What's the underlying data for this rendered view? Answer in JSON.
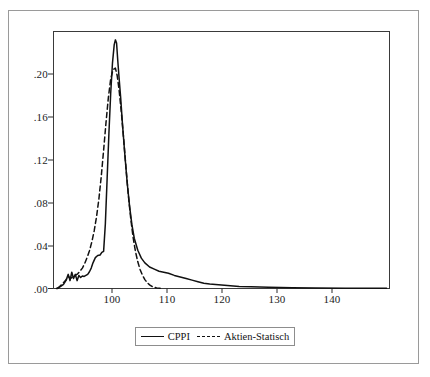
{
  "chart_data": {
    "type": "line",
    "title": "",
    "subtitle": "",
    "xlabel": "",
    "ylabel": "",
    "xlim": [
      91.5,
      148.5
    ],
    "ylim": [
      0.0,
      0.2455
    ],
    "grid": false,
    "legend_position": "bottom-center",
    "xticks": [
      100,
      110,
      120,
      130,
      140
    ],
    "xtick_labels": [
      "100",
      "110",
      "120",
      "130",
      "140"
    ],
    "yticks": [
      0.0,
      0.04,
      0.08,
      0.12,
      0.16,
      0.2
    ],
    "ytick_labels": [
      ".00",
      ".04",
      ".08",
      ".12",
      ".16",
      ".20"
    ],
    "series": [
      {
        "name": "CPPI",
        "style": "solid",
        "color": "#111111",
        "x": [
          92.0,
          92.6,
          93.2,
          93.6,
          94.0,
          94.3,
          94.6,
          94.9,
          95.2,
          95.5,
          95.8,
          96.1,
          96.4,
          96.7,
          97.0,
          97.3,
          97.6,
          97.9,
          98.2,
          98.6,
          99.0,
          99.4,
          99.7,
          100.0,
          100.3,
          100.6,
          100.9,
          101.2,
          101.5,
          101.8,
          102.0,
          102.2,
          102.4,
          102.6,
          102.9,
          103.2,
          103.6,
          104.0,
          104.4,
          104.8,
          105.2,
          105.8,
          106.4,
          107.0,
          107.8,
          108.6,
          109.4,
          110.2,
          111.0,
          112.0,
          113.0,
          114.0,
          115.0,
          116.0,
          117.0,
          118.0,
          119.5,
          121.0,
          123.0,
          125.0,
          128.0,
          132.0,
          136.0,
          141.0,
          148.0
        ],
        "y": [
          0.0,
          0.0015,
          0.004,
          0.0075,
          0.0135,
          0.0075,
          0.0155,
          0.0095,
          0.0135,
          0.0075,
          0.0125,
          0.0105,
          0.012,
          0.0115,
          0.0125,
          0.0135,
          0.016,
          0.0195,
          0.0245,
          0.0295,
          0.0315,
          0.032,
          0.0345,
          0.0355,
          0.062,
          0.105,
          0.148,
          0.186,
          0.215,
          0.233,
          0.2375,
          0.2345,
          0.218,
          0.203,
          0.182,
          0.157,
          0.128,
          0.101,
          0.079,
          0.061,
          0.048,
          0.0365,
          0.029,
          0.0245,
          0.0205,
          0.0185,
          0.0165,
          0.0155,
          0.0145,
          0.0125,
          0.011,
          0.0095,
          0.008,
          0.0065,
          0.005,
          0.0042,
          0.0035,
          0.0028,
          0.002,
          0.0016,
          0.0012,
          0.0008,
          0.0005,
          0.0003,
          0.0002
        ]
      },
      {
        "name": "Aktien-Statisch",
        "style": "dashed",
        "color": "#111111",
        "x": [
          92.2,
          93.0,
          93.6,
          94.0,
          94.4,
          94.8,
          95.2,
          95.6,
          96.0,
          96.4,
          96.8,
          97.2,
          97.6,
          98.0,
          98.4,
          98.8,
          99.2,
          99.6,
          100.0,
          100.4,
          100.8,
          101.2,
          101.6,
          102.0,
          102.3,
          102.6,
          103.0,
          103.4,
          103.8,
          104.2,
          104.6,
          105.0,
          105.4,
          105.8,
          106.2,
          106.6,
          107.0,
          107.4,
          107.8,
          108.2,
          108.6,
          109.0,
          109.5,
          110.0
        ],
        "y": [
          0.0,
          0.0045,
          0.008,
          0.0115,
          0.0095,
          0.0115,
          0.0125,
          0.014,
          0.0165,
          0.0195,
          0.024,
          0.0295,
          0.036,
          0.0445,
          0.055,
          0.0685,
          0.0855,
          0.107,
          0.132,
          0.158,
          0.182,
          0.2,
          0.209,
          0.2105,
          0.2035,
          0.191,
          0.169,
          0.143,
          0.115,
          0.089,
          0.067,
          0.049,
          0.0355,
          0.0255,
          0.018,
          0.0125,
          0.0085,
          0.0055,
          0.0035,
          0.002,
          0.0012,
          0.0006,
          0.0002,
          0.0
        ]
      }
    ],
    "legend": [
      {
        "label": "CPPI",
        "style": "solid"
      },
      {
        "label": "Aktien-Statisch",
        "style": "dashed"
      }
    ]
  },
  "figure": {
    "border_color": "#9a9a9a",
    "background": "#ffffff",
    "axis_color": "#333333"
  }
}
